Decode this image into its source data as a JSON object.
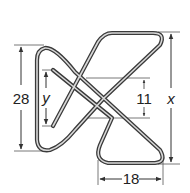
{
  "diagram": {
    "colors": {
      "wire_outer": "#3a3a3a",
      "wire_inner": "#d8d8d8",
      "dimension_line": "#555555",
      "text": "#222222",
      "background": "#ffffff"
    },
    "dimensions": {
      "left_height": {
        "label": "28"
      },
      "inner_left": {
        "label": "y"
      },
      "center_gap": {
        "label": "11"
      },
      "right_height": {
        "label": "x"
      },
      "bottom_width": {
        "label": "18"
      }
    }
  }
}
